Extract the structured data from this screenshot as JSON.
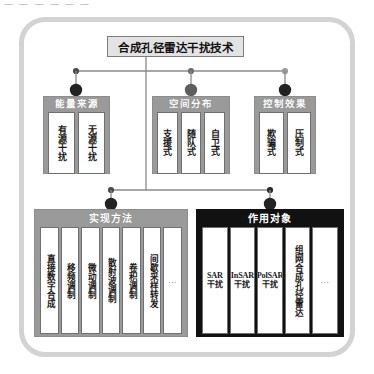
{
  "scrap_text": "一 一 一 一 一 一",
  "colors": {
    "frame": "#d3d3d3",
    "gray_panel": "#9a9a9a",
    "dark_panel": "#111111",
    "root_box": "#e3e3e3",
    "node_dark": "#2b2b2b",
    "node_mid": "#6e6e6e",
    "wire": "#8a8a8a"
  },
  "root": {
    "label": "合成孔径雷达干扰技术"
  },
  "groups": [
    {
      "id": "energy",
      "title": "能量来源",
      "items": [
        {
          "label": "有源干扰"
        },
        {
          "label": "无源干扰"
        }
      ]
    },
    {
      "id": "space",
      "title": "空间分布",
      "items": [
        {
          "label": "支援式"
        },
        {
          "label": "随队式"
        },
        {
          "label": "自卫式"
        }
      ]
    },
    {
      "id": "effect",
      "title": "控制效果",
      "items": [
        {
          "label": "欺骗式"
        },
        {
          "label": "压制式"
        }
      ]
    },
    {
      "id": "method",
      "title": "实现方法",
      "items": [
        {
          "label": "直接数字合成"
        },
        {
          "label": "移频调制"
        },
        {
          "label": "微动调制"
        },
        {
          "label": "散射波调制"
        },
        {
          "label": "卷积调制"
        },
        {
          "label": "间歇采样转发"
        },
        {
          "label": "…"
        }
      ]
    },
    {
      "id": "target",
      "title": "作用对象",
      "items": [
        {
          "code": "SAR",
          "label": "干扰"
        },
        {
          "code": "InSAR",
          "label": "干扰"
        },
        {
          "code": "PolSAR",
          "label": "干扰"
        },
        {
          "label": "组网合成孔径雷达"
        },
        {
          "label": "…"
        }
      ]
    }
  ]
}
